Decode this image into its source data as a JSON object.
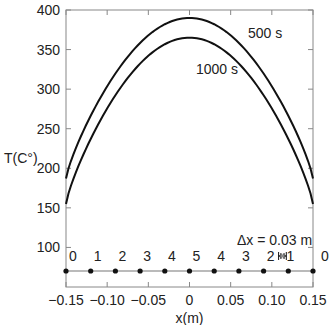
{
  "chart_data": {
    "type": "line",
    "title": "",
    "xlabel": "x(m)",
    "ylabel": "T(C°)",
    "xlim": [
      -0.15,
      0.15
    ],
    "ylim": [
      50,
      400
    ],
    "x_ticks": [
      -0.15,
      -0.1,
      -0.05,
      0,
      0.05,
      0.1,
      0.15
    ],
    "x_tick_labels": [
      "−0.15",
      "−0.10",
      "−0.05",
      "0",
      "0.05",
      "0.10",
      "0.15"
    ],
    "y_ticks": [
      100,
      150,
      200,
      250,
      300,
      350,
      400
    ],
    "y_tick_labels": [
      "100",
      "150",
      "200",
      "250",
      "300",
      "350",
      "400"
    ],
    "grid": false,
    "series": [
      {
        "name": "500 s",
        "x": [
          -0.15,
          -0.12,
          -0.09,
          -0.06,
          -0.03,
          0,
          0.03,
          0.06,
          0.09,
          0.12,
          0.15
        ],
        "values": [
          187,
          255,
          315,
          360,
          385,
          390,
          385,
          360,
          315,
          255,
          187
        ]
      },
      {
        "name": "1000 s",
        "x": [
          -0.15,
          -0.12,
          -0.09,
          -0.06,
          -0.03,
          0,
          0.03,
          0.06,
          0.09,
          0.12,
          0.15
        ],
        "values": [
          155,
          225,
          285,
          333,
          358,
          365,
          358,
          333,
          285,
          225,
          155
        ]
      }
    ],
    "nodes": {
      "y_level": 70,
      "x": [
        -0.15,
        -0.12,
        -0.09,
        -0.06,
        -0.03,
        0,
        0.03,
        0.06,
        0.09,
        0.12,
        0.15
      ],
      "labels": [
        "0",
        "1",
        "2",
        "3",
        "4",
        "5",
        "4",
        "3",
        "2",
        "1",
        "0"
      ]
    },
    "annotations": [
      {
        "text": "500 s",
        "x": 0.09,
        "y": 375
      },
      {
        "text": "1000 s",
        "x": 0.04,
        "y": 338
      },
      {
        "text": "Δx = 0.03 m",
        "x": 0.075,
        "y": 85
      }
    ]
  }
}
